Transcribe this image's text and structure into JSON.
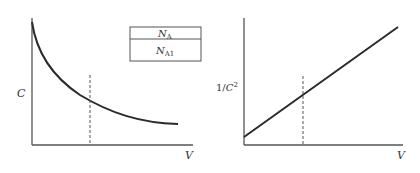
{
  "left_plot": {
    "ylabel": "C",
    "xlabel": "V",
    "curve": "decreasing convex (C vs V)",
    "legend": {
      "top_main": "N",
      "top_sub": "A",
      "bottom_main": "N",
      "bottom_sub": "A1"
    }
  },
  "right_plot": {
    "ylabel_prefix": "1/",
    "ylabel_var": "C",
    "ylabel_exp": "2",
    "xlabel": "V",
    "curve": "increasing linear (1/C^2 vs V)"
  },
  "colors": {
    "line": "#2a2a2a",
    "axis": "#555555",
    "dash": "#555555"
  }
}
